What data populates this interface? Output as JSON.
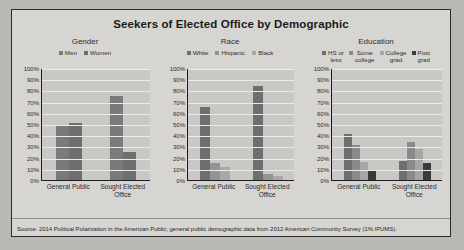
{
  "chart_data": {
    "type": "bar",
    "title": "Seekers of Elected Office by Demographic",
    "categories": [
      "General Public",
      "Sought Elected Office"
    ],
    "ylabel": "",
    "ylim": [
      0,
      100
    ],
    "ytick_labels": [
      "100%",
      "90%",
      "80%",
      "70%",
      "60%",
      "50%",
      "40%",
      "30%",
      "20%",
      "10%",
      "0%"
    ],
    "grid": true,
    "legend_position": "top",
    "panels": [
      {
        "name": "Gender",
        "series": [
          {
            "name": "Men",
            "color": "#7a7a7a",
            "values": [
              49,
              75
            ]
          },
          {
            "name": "Women",
            "color": "#6e6e6e",
            "values": [
              51,
              25
            ]
          }
        ]
      },
      {
        "name": "Race",
        "series": [
          {
            "name": "White",
            "color": "#6e6e6e",
            "values": [
              65,
              84
            ]
          },
          {
            "name": "Hispanic",
            "color": "#949494",
            "values": [
              15,
              5
            ]
          },
          {
            "name": "Black",
            "color": "#a8a8a8",
            "values": [
              12,
              4
            ]
          }
        ]
      },
      {
        "name": "Education",
        "series": [
          {
            "name": "HS or\nless",
            "color": "#6e6e6e",
            "values": [
              41,
              17
            ]
          },
          {
            "name": "Some\ncollege",
            "color": "#8a8a8a",
            "values": [
              31,
              34
            ]
          },
          {
            "name": "College\ngrad",
            "color": "#a6a6a6",
            "values": [
              16,
              28
            ]
          },
          {
            "name": "Post\ngrad",
            "color": "#3a3a3a",
            "values": [
              9,
              15
            ]
          }
        ]
      }
    ],
    "source": "Source: 2014 Political Polarization in the American Public; general public demographic data from 2012 American Community Survey (1% IPUMS)."
  }
}
